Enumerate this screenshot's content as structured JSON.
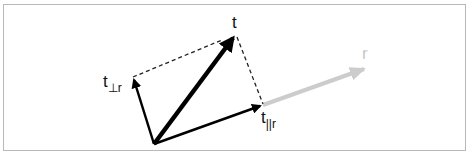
{
  "diagram": {
    "labels": {
      "t": "t",
      "t_perp_base": "t",
      "t_perp_sub": "⊥r",
      "t_par_base": "t",
      "t_par_sub": "||r",
      "r": "r"
    },
    "colors": {
      "vector": "#000000",
      "reference": "#cccccc",
      "dashed": "#222222",
      "frame": "#b8b8b8"
    },
    "nodes": [
      {
        "id": "origin",
        "x": 154,
        "y": 144
      },
      {
        "id": "t",
        "x": 236,
        "y": 34
      },
      {
        "id": "t_perp_r",
        "x": 133,
        "y": 76
      },
      {
        "id": "t_par_r",
        "x": 263,
        "y": 105
      },
      {
        "id": "r",
        "x": 367,
        "y": 68
      }
    ],
    "edges": [
      {
        "from": "origin",
        "to": "t",
        "style": "thick-arrow"
      },
      {
        "from": "origin",
        "to": "t_perp_r",
        "style": "arrow"
      },
      {
        "from": "origin",
        "to": "t_par_r",
        "style": "arrow"
      },
      {
        "from": "t_par_r",
        "to": "r",
        "style": "gray-arrow"
      },
      {
        "from": "t_perp_r",
        "to": "t",
        "style": "dashed"
      },
      {
        "from": "t",
        "to": "t_par_r",
        "style": "dashed"
      }
    ]
  }
}
